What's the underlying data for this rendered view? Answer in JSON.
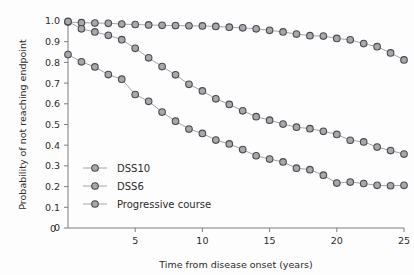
{
  "chart_data": {
    "type": "line",
    "title": "",
    "xlabel": "Time from disease onset (years)",
    "ylabel": "Probability of not reaching endpoint",
    "xlim": [
      0,
      25
    ],
    "ylim": [
      0,
      1.0
    ],
    "grid": false,
    "legend_position": "center-left",
    "xticks": [
      0,
      5,
      10,
      15,
      20,
      25
    ],
    "xtick_labels": [
      "0",
      "5",
      "10",
      "15",
      "20",
      "25"
    ],
    "yticks": [
      0,
      0.1,
      0.2,
      0.3,
      0.4,
      0.5,
      0.6,
      0.7,
      0.8,
      0.9,
      1.0
    ],
    "ytick_labels": [
      "0",
      "0.1",
      "0.2",
      "0.3",
      "0.4",
      "0.5",
      "0.6",
      "0.7",
      "0.8",
      "0.9",
      "1.0"
    ],
    "x": [
      0,
      1,
      2,
      3,
      4,
      5,
      6,
      7,
      8,
      9,
      10,
      11,
      12,
      13,
      14,
      15,
      16,
      17,
      18,
      19,
      20,
      21,
      22,
      23,
      24,
      25
    ],
    "marker": "circle",
    "marker_fill": "#a8a8a8",
    "marker_edge": "#4a4a56",
    "line_color": "#9a9a9a",
    "series": [
      {
        "name": "DSS10",
        "values": [
          0.995,
          0.992,
          0.99,
          0.989,
          0.985,
          0.983,
          0.981,
          0.979,
          0.978,
          0.977,
          0.976,
          0.974,
          0.97,
          0.967,
          0.962,
          0.955,
          0.947,
          0.937,
          0.929,
          0.927,
          0.916,
          0.909,
          0.891,
          0.876,
          0.846,
          0.812
        ]
      },
      {
        "name": "DSS6",
        "values": [
          0.998,
          0.962,
          0.947,
          0.931,
          0.91,
          0.868,
          0.822,
          0.78,
          0.74,
          0.694,
          0.662,
          0.624,
          0.597,
          0.566,
          0.538,
          0.521,
          0.502,
          0.487,
          0.48,
          0.467,
          0.452,
          0.424,
          0.416,
          0.391,
          0.374,
          0.357
        ]
      },
      {
        "name": "Progressive course",
        "values": [
          0.838,
          0.803,
          0.778,
          0.741,
          0.719,
          0.645,
          0.612,
          0.56,
          0.516,
          0.478,
          0.457,
          0.425,
          0.406,
          0.379,
          0.349,
          0.333,
          0.319,
          0.289,
          0.282,
          0.255,
          0.217,
          0.222,
          0.215,
          0.206,
          0.204,
          0.206
        ]
      }
    ]
  },
  "legend": {
    "items": [
      {
        "label": "DSS10"
      },
      {
        "label": "DSS6"
      },
      {
        "label": "Progressive course"
      }
    ]
  }
}
